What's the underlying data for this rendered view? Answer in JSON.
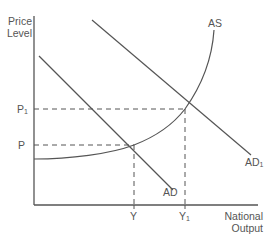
{
  "diagram": {
    "type": "AD-AS",
    "y_axis": {
      "label_line1": "Price",
      "label_line2": "Level"
    },
    "x_axis": {
      "label_line1": "National",
      "label_line2": "Output"
    },
    "price_levels": [
      {
        "name": "P1",
        "base": "P",
        "sub": "1"
      },
      {
        "name": "P",
        "base": "P",
        "sub": ""
      }
    ],
    "output_levels": [
      {
        "name": "Y",
        "base": "Y",
        "sub": ""
      },
      {
        "name": "Y1",
        "base": "Y",
        "sub": "1"
      }
    ],
    "curves": [
      {
        "name": "AS",
        "label": "AS",
        "label_sub": ""
      },
      {
        "name": "AD",
        "label": "AD",
        "label_sub": ""
      },
      {
        "name": "AD1",
        "label": "AD",
        "label_sub": "1"
      }
    ],
    "colors": {
      "line": "#555555",
      "text": "#555555",
      "background": "#ffffff"
    }
  }
}
